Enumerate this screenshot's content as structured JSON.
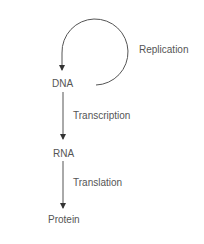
{
  "diagram": {
    "nodes": [
      {
        "id": "dna",
        "label": "DNA"
      },
      {
        "id": "rna",
        "label": "RNA"
      },
      {
        "id": "protein",
        "label": "Protein"
      }
    ],
    "edges": [
      {
        "from": "dna",
        "to": "dna",
        "label": "Replication"
      },
      {
        "from": "dna",
        "to": "rna",
        "label": "Transcription"
      },
      {
        "from": "rna",
        "to": "protein",
        "label": "Translation"
      }
    ],
    "colors": {
      "line": "#444444",
      "text": "#555555"
    }
  }
}
